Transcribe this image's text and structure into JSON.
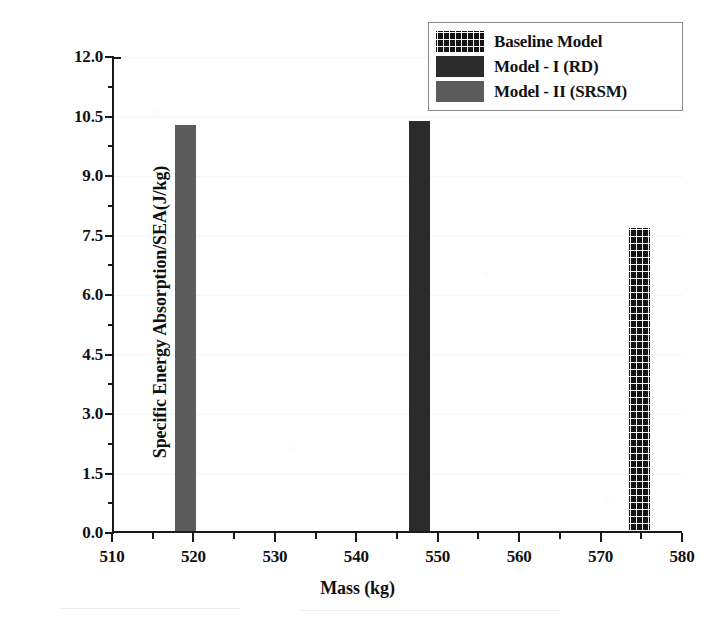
{
  "chart_data": {
    "type": "bar",
    "title": "",
    "xlabel": "Mass (kg)",
    "ylabel": "Specific Energy Absorption/SEA(J/kg)",
    "xlim": [
      510,
      580
    ],
    "ylim": [
      0.0,
      12.0
    ],
    "grid": false,
    "legend_position": "top-right",
    "x_ticks": [
      510,
      520,
      530,
      540,
      550,
      560,
      570,
      580
    ],
    "x_tick_labels": [
      "510",
      "520",
      "530",
      "540",
      "550",
      "560",
      "570",
      "580"
    ],
    "x_minor_ticks": [
      515,
      525,
      535,
      545,
      555,
      565,
      575
    ],
    "y_ticks": [
      0.0,
      1.5,
      3.0,
      4.5,
      6.0,
      7.5,
      9.0,
      10.5,
      12.0
    ],
    "y_tick_labels": [
      "0.0",
      "1.5",
      "3.0",
      "4.5",
      "6.0",
      "7.5",
      "9.0",
      "10.5",
      "12.0"
    ],
    "y_minor_ticks": [
      0.75,
      2.25,
      3.75,
      5.25,
      6.75,
      8.25,
      9.75,
      11.25
    ],
    "bar_width_kg": 2.6,
    "series": [
      {
        "name": "Baseline Model",
        "pattern": "crosshatch",
        "color": "#141414",
        "x": 574.5,
        "value": 7.63
      },
      {
        "name": "Model - I (RD)",
        "pattern": "solid-dark",
        "color": "#2b2b2b",
        "x": 547.5,
        "value": 10.33
      },
      {
        "name": "Model - II (SRSM)",
        "pattern": "solid-gray",
        "color": "#5b5b5b",
        "x": 518.8,
        "value": 10.23
      }
    ],
    "legend_entries": [
      {
        "label": "Baseline Model",
        "pattern": "crosshatch"
      },
      {
        "label": "Model - I (RD)",
        "pattern": "solid-dark"
      },
      {
        "label": "Model - II (SRSM)",
        "pattern": "solid-gray"
      }
    ]
  }
}
